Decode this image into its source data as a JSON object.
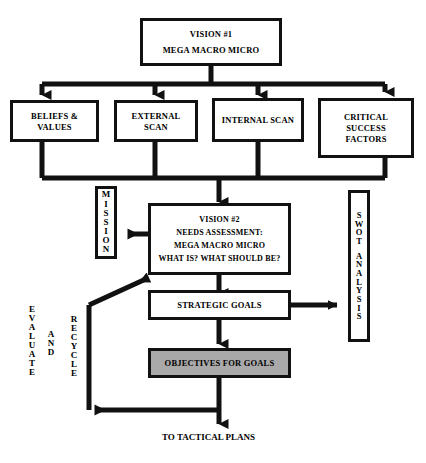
{
  "diagram": {
    "title_caption": "TO TACTICAL PLANS",
    "colors": {
      "stroke": "#111111",
      "fill": "#ffffff",
      "shaded_fill": "#a9a9a9",
      "text": "#000000",
      "background": "#ffffff"
    },
    "nodes": {
      "vision1": {
        "lines": [
          "VISION #1",
          "MEGA  MACRO  MICRO"
        ]
      },
      "beliefs": {
        "lines": [
          "BELIEFS &",
          "VALUES"
        ]
      },
      "external": {
        "lines": [
          "EXTERNAL",
          "SCAN"
        ]
      },
      "internal": {
        "lines": [
          "INTERNAL SCAN"
        ]
      },
      "critical": {
        "lines": [
          "CRITICAL",
          "SUCCESS",
          "FACTORS"
        ]
      },
      "vision2": {
        "lines": [
          "VISION #2",
          "NEEDS ASSESSMENT:",
          "MEGA  MACRO  MICRO",
          "WHAT IS?  WHAT SHOULD BE?"
        ]
      },
      "strategic_goals": {
        "lines": [
          "STRATEGIC GOALS"
        ]
      },
      "objectives": {
        "lines": [
          "OBJECTIVES FOR GOALS"
        ],
        "shaded": true
      }
    },
    "vertical_labels": {
      "mission": {
        "text": "MISSION",
        "chars": [
          "M",
          "I",
          "S",
          "S",
          "I",
          "O",
          "N"
        ]
      },
      "swot": {
        "text": "SWOT ANALYSIS",
        "chars_top": [
          "S",
          "W",
          "O",
          "T"
        ],
        "chars_bottom": [
          "A",
          "N",
          "A",
          "L",
          "Y",
          "S",
          "I",
          "S"
        ]
      },
      "evaluate": {
        "text": "EVALUATE",
        "chars": [
          "E",
          "V",
          "A",
          "L",
          "U",
          "A",
          "T",
          "E"
        ]
      },
      "and": {
        "text": "AND",
        "chars": [
          "A",
          "N",
          "D"
        ]
      },
      "recycle": {
        "text": "RECYCLE",
        "chars": [
          "R",
          "E",
          "C",
          "Y",
          "C",
          "L",
          "E"
        ]
      }
    }
  }
}
